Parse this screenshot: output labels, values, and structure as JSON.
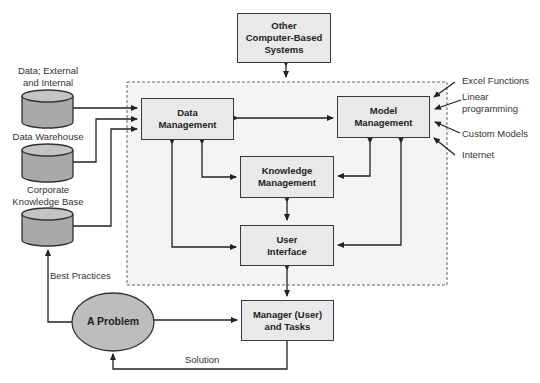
{
  "diagram": {
    "type": "flowchart",
    "colors": {
      "box_fill": "#e9e9e9",
      "region_fill": "#f4f4f4",
      "cylinder_fill": "#a9a9a9",
      "ellipse_fill": "#bdbdbd",
      "stroke": "#333333"
    },
    "nodes": {
      "other_systems": {
        "line1": "Other",
        "line2": "Computer-Based",
        "line3": "Systems"
      },
      "data_management": {
        "line1": "Data",
        "line2": "Management"
      },
      "model_management": {
        "line1": "Model",
        "line2": "Management"
      },
      "knowledge_management": {
        "line1": "Knowledge",
        "line2": "Management"
      },
      "user_interface": {
        "line1": "User",
        "line2": "Interface"
      },
      "manager_tasks": {
        "line1": "Manager (User)",
        "line2": "and Tasks"
      },
      "problem": {
        "label": "A Problem"
      }
    },
    "data_sources": [
      {
        "line1": "Data; External",
        "line2": "and Internal"
      },
      {
        "line1": "Data Warehouse"
      },
      {
        "line1": "Corporate",
        "line2": "Knowledge Base"
      }
    ],
    "model_inputs": [
      {
        "line1": "Excel Functions"
      },
      {
        "line1": "Linear",
        "line2": "programming"
      },
      {
        "line1": "Custom Models"
      },
      {
        "line1": "Internet"
      }
    ],
    "edge_labels": {
      "best_practices": "Best Practices",
      "solution": "Solution"
    }
  }
}
